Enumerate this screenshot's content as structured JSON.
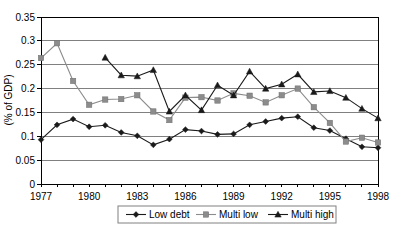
{
  "chart_data": {
    "type": "line",
    "title": "",
    "xlabel": "",
    "ylabel": "(% of GDP)",
    "xlim": [
      1977,
      1998
    ],
    "ylim": [
      0,
      0.35
    ],
    "grid": true,
    "legend_position": "bottom",
    "x": [
      1977,
      1978,
      1979,
      1980,
      1981,
      1982,
      1983,
      1984,
      1985,
      1986,
      1987,
      1988,
      1989,
      1990,
      1991,
      1992,
      1993,
      1994,
      1995,
      1996,
      1997,
      1998
    ],
    "y_ticks": [
      0,
      0.05,
      0.1,
      0.15,
      0.2,
      0.25,
      0.3,
      0.35
    ],
    "y_tick_labels": [
      "0",
      "0.05",
      "0.1",
      "0.15",
      "0.2",
      "0.25",
      "0.3",
      "0.35"
    ],
    "x_ticks": [
      1977,
      1980,
      1983,
      1986,
      1989,
      1992,
      1995,
      1998
    ],
    "x_tick_labels": [
      "1977",
      "1980",
      "1983",
      "1986",
      "1989",
      "1992",
      "1995",
      "1998"
    ],
    "series": [
      {
        "name": "Low debt",
        "marker": "diamond",
        "color": "#1a1a1a",
        "x": [
          1977,
          1978,
          1979,
          1980,
          1981,
          1982,
          1983,
          1984,
          1985,
          1986,
          1987,
          1988,
          1989,
          1990,
          1991,
          1992,
          1993,
          1994,
          1995,
          1996,
          1997,
          1998
        ],
        "values": [
          0.093,
          0.124,
          0.136,
          0.12,
          0.123,
          0.108,
          0.101,
          0.082,
          0.094,
          0.114,
          0.111,
          0.104,
          0.105,
          0.124,
          0.131,
          0.138,
          0.141,
          0.118,
          0.112,
          0.095,
          0.078,
          0.076
        ]
      },
      {
        "name": "Multi low",
        "marker": "square",
        "color": "#8c8c8c",
        "x": [
          1977,
          1978,
          1979,
          1980,
          1981,
          1982,
          1983,
          1984,
          1985,
          1986,
          1987,
          1988,
          1989,
          1990,
          1991,
          1992,
          1993,
          1994,
          1995,
          1996,
          1997,
          1998
        ],
        "values": [
          0.264,
          0.295,
          0.216,
          0.166,
          0.177,
          0.178,
          0.186,
          0.152,
          0.134,
          0.181,
          0.182,
          0.175,
          0.19,
          0.185,
          0.171,
          0.186,
          0.2,
          0.161,
          0.128,
          0.089,
          0.097,
          0.087
        ]
      },
      {
        "name": "Multi high",
        "marker": "triangle",
        "color": "#1a1a1a",
        "x": [
          1981,
          1982,
          1983,
          1984,
          1985,
          1986,
          1987,
          1988,
          1989,
          1990,
          1991,
          1992,
          1993,
          1994,
          1995,
          1996,
          1997,
          1998
        ],
        "values": [
          0.265,
          0.228,
          0.226,
          0.239,
          0.152,
          0.186,
          0.155,
          0.207,
          0.186,
          0.236,
          0.2,
          0.209,
          0.23,
          0.193,
          0.195,
          0.181,
          0.158,
          0.138
        ]
      }
    ]
  },
  "legend": {
    "items": [
      {
        "label": "Low debt"
      },
      {
        "label": "Multi low"
      },
      {
        "label": "Multi high"
      }
    ]
  }
}
